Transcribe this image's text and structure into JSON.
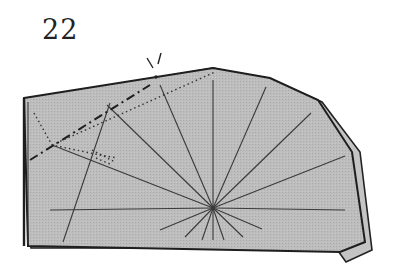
{
  "step": {
    "number": "22"
  },
  "diagram": {
    "type": "origami-fold-step",
    "paper_color": "#b9b9b9",
    "line_color": "#2a2a2a",
    "elements": [
      "paper-shape",
      "radial-crease-fan",
      "valley-fold-line",
      "mountain-fold-line",
      "x-ray-dotted-lines",
      "pivot-point-marker"
    ]
  }
}
